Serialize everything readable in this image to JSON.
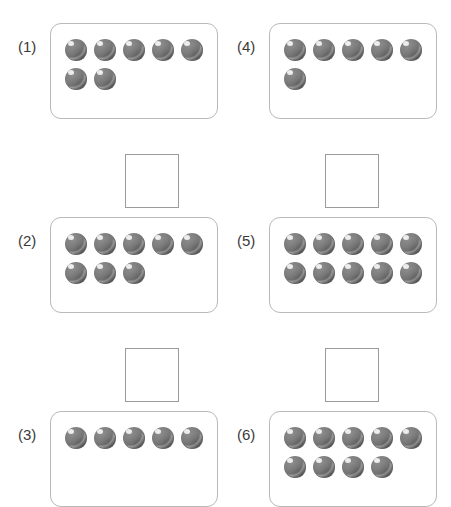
{
  "worksheet": {
    "title": "Counting worksheet",
    "canvas": {
      "width": 451,
      "height": 500
    },
    "background_color": "#ffffff",
    "counter_color": "#7a7a7a",
    "counter_highlight_color": "#ededed",
    "box_border_color": "#b9b9b9",
    "answer_box_border_color": "#9b9b9b",
    "label_color": "#3a3a3a",
    "columns": 2,
    "counters_per_full_row": 5
  },
  "problems": [
    {
      "id": "p1",
      "label": "(1)",
      "total_counters": 7,
      "rows": [
        5,
        2
      ],
      "column": 0,
      "row_index": 0,
      "left": 18,
      "top": 18,
      "box": {
        "left": 32,
        "top": 5,
        "width": 168,
        "height": 96
      },
      "answer_box": {
        "left": 107,
        "top": 136,
        "width": 54,
        "height": 54
      },
      "has_answer_box": true
    },
    {
      "id": "p2",
      "label": "(2)",
      "total_counters": 8,
      "rows": [
        5,
        3
      ],
      "column": 0,
      "row_index": 1,
      "left": 18,
      "top": 212,
      "box": {
        "left": 32,
        "top": 5,
        "width": 168,
        "height": 96
      },
      "answer_box": {
        "left": 107,
        "top": 136,
        "width": 54,
        "height": 54
      },
      "has_answer_box": true
    },
    {
      "id": "p3",
      "label": "(3)",
      "total_counters": 5,
      "rows": [
        5
      ],
      "column": 0,
      "row_index": 2,
      "left": 18,
      "top": 406,
      "box": {
        "left": 32,
        "top": 5,
        "width": 168,
        "height": 96
      },
      "answer_box": null,
      "has_answer_box": false
    },
    {
      "id": "p4",
      "label": "(4)",
      "total_counters": 6,
      "rows": [
        5,
        1
      ],
      "column": 1,
      "row_index": 0,
      "left": 237,
      "top": 18,
      "box": {
        "left": 32,
        "top": 5,
        "width": 168,
        "height": 96
      },
      "answer_box": {
        "left": 88,
        "top": 136,
        "width": 54,
        "height": 54
      },
      "has_answer_box": true
    },
    {
      "id": "p5",
      "label": "(5)",
      "total_counters": 10,
      "rows": [
        5,
        5
      ],
      "column": 1,
      "row_index": 1,
      "left": 237,
      "top": 212,
      "box": {
        "left": 32,
        "top": 5,
        "width": 168,
        "height": 96
      },
      "answer_box": {
        "left": 88,
        "top": 136,
        "width": 54,
        "height": 54
      },
      "has_answer_box": true
    },
    {
      "id": "p6",
      "label": "(6)",
      "total_counters": 9,
      "rows": [
        5,
        4
      ],
      "column": 1,
      "row_index": 2,
      "left": 237,
      "top": 406,
      "box": {
        "left": 32,
        "top": 5,
        "width": 168,
        "height": 96
      },
      "answer_box": null,
      "has_answer_box": false
    }
  ]
}
